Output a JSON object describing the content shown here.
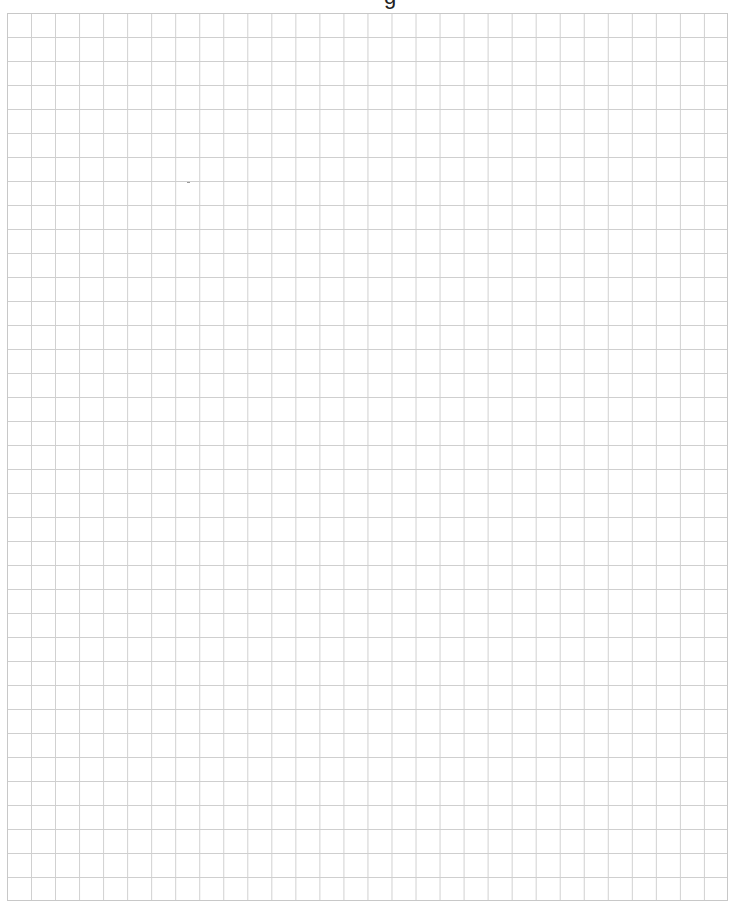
{
  "page": {
    "type": "grid-paper",
    "background_color": "#ffffff",
    "line_color": "#cfcfcf",
    "border_color": "#c8c8c8"
  },
  "header": {
    "cropped_text": "g"
  },
  "grid": {
    "columns": 30,
    "rows": 37,
    "cell_width_px": 24,
    "cell_height_px": 24,
    "left_px": 7,
    "top_px": 13,
    "width_px": 721,
    "height_px": 888
  },
  "marks": [
    {
      "type": "stray-dash",
      "x": 188,
      "y": 183
    }
  ]
}
